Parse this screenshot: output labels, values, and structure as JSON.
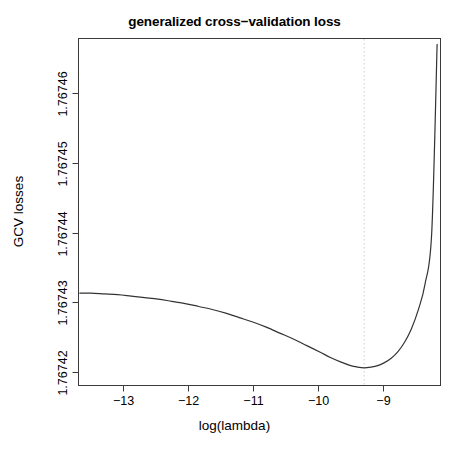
{
  "chart_data": {
    "type": "line",
    "title": "generalized cross−validation loss",
    "xlabel": "log(lambda)",
    "ylabel": "GCV losses",
    "xlim": [
      -13.58,
      -8.22
    ],
    "ylim": [
      1.7674185,
      1.7674655
    ],
    "xticks": [
      -13,
      -12,
      -11,
      -10,
      -9
    ],
    "xtick_labels": [
      "−13",
      "−12",
      "−11",
      "−10",
      "−9"
    ],
    "yticks": [
      1.76742,
      1.76743,
      1.76744,
      1.76745,
      1.76746
    ],
    "ytick_labels": [
      "1.76742",
      "1.76743",
      "1.76744",
      "1.76745",
      "1.76746"
    ],
    "grid": false,
    "legend": null,
    "box": true,
    "annotations": [
      {
        "name": "optimal-lambda-marker",
        "type": "vertical-dotted-line",
        "x": -9.35,
        "color": "#cccccc"
      }
    ],
    "series": [
      {
        "name": "GCV loss",
        "color": "#333333",
        "x": [
          -13.56,
          -13.4,
          -13.2,
          -13.0,
          -12.8,
          -12.6,
          -12.4,
          -12.2,
          -12.0,
          -11.8,
          -11.6,
          -11.4,
          -11.2,
          -11.0,
          -10.8,
          -10.6,
          -10.4,
          -10.2,
          -10.0,
          -9.85,
          -9.7,
          -9.55,
          -9.45,
          -9.35,
          -9.25,
          -9.15,
          -9.05,
          -8.95,
          -8.85,
          -8.75,
          -8.65,
          -8.55,
          -8.45,
          -8.35,
          -8.27
        ],
        "y": [
          1.767431,
          1.767431,
          1.7674309,
          1.7674308,
          1.7674306,
          1.7674304,
          1.7674302,
          1.7674299,
          1.7674296,
          1.7674292,
          1.7674288,
          1.7674283,
          1.7674277,
          1.7674271,
          1.7674264,
          1.7674256,
          1.7674248,
          1.7674239,
          1.767423,
          1.7674223,
          1.7674217,
          1.7674212,
          1.767421,
          1.7674209,
          1.767421,
          1.7674212,
          1.7674216,
          1.7674222,
          1.7674231,
          1.7674244,
          1.7674262,
          1.7674287,
          1.7674322,
          1.7674392,
          1.7674647
        ]
      }
    ]
  },
  "axes": {
    "title": "generalized cross−validation loss",
    "xlabel": "log(lambda)",
    "ylabel": "GCV losses"
  }
}
